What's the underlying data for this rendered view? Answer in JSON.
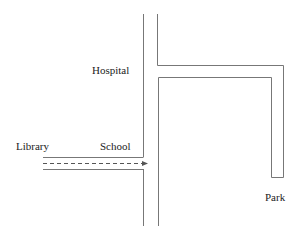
{
  "map": {
    "labels": {
      "hospital": "Hospital",
      "library": "Library",
      "school": "School",
      "park": "Park"
    },
    "line_color": "#777777",
    "route_color": "#555555"
  }
}
